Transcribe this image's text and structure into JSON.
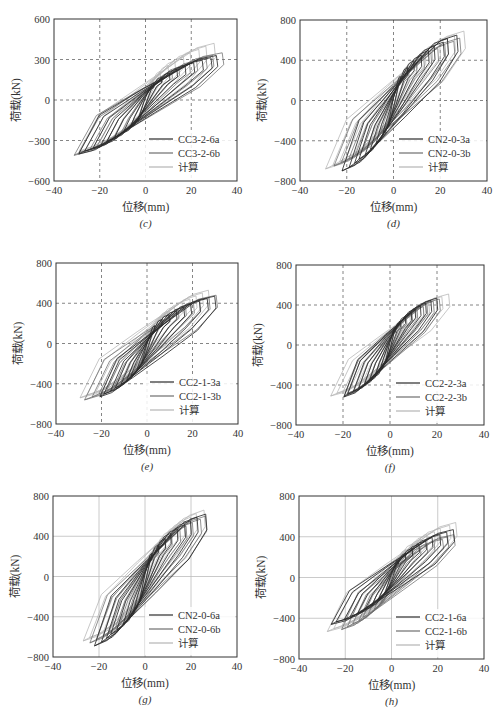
{
  "figure": {
    "xlabel": "位移(mm)",
    "ylabel": "荷载(kN)"
  },
  "series_styles": {
    "a": {
      "color": "#2b2b2b"
    },
    "b": {
      "color": "#6e6e6e"
    },
    "calc": {
      "color": "#b4b4b4"
    }
  },
  "chart_data": [
    {
      "type": "line",
      "panel": "c",
      "caption": "(c)",
      "xlabel": "位移(mm)",
      "ylabel": "荷载(kN)",
      "xlim": [
        -40,
        40
      ],
      "ylim": [
        -600,
        600
      ],
      "xticks": [
        -40,
        -20,
        0,
        20,
        40
      ],
      "yticks": [
        -600,
        -300,
        0,
        300,
        600
      ],
      "grid": "dashed at inner ticks",
      "legend": "bottom-right",
      "series": [
        {
          "name": "CC3-2-6a",
          "style": "a",
          "peak_disp": [
            32,
            -30
          ],
          "peak_load": [
            330,
            -400
          ]
        },
        {
          "name": "CC3-2-6b",
          "style": "b",
          "peak_disp": [
            34,
            -32
          ],
          "peak_load": [
            350,
            -410
          ]
        },
        {
          "name": "计算",
          "style": "calc",
          "peak_disp": [
            30,
            -30
          ],
          "peak_load": [
            420,
            -380
          ]
        }
      ]
    },
    {
      "type": "line",
      "panel": "d",
      "caption": "(d)",
      "xlabel": "位移(mm)",
      "ylabel": "荷载(kN)",
      "xlim": [
        -40,
        40
      ],
      "ylim": [
        -800,
        800
      ],
      "xticks": [
        -40,
        -20,
        0,
        20,
        40
      ],
      "yticks": [
        -800,
        -400,
        0,
        400,
        800
      ],
      "grid": "dashed at inner ticks",
      "legend": "bottom-right",
      "series": [
        {
          "name": "CN2-0-3a",
          "style": "a",
          "peak_disp": [
            27,
            -22
          ],
          "peak_load": [
            650,
            -700
          ]
        },
        {
          "name": "CN2-0-3b",
          "style": "b",
          "peak_disp": [
            29,
            -25
          ],
          "peak_load": [
            620,
            -650
          ]
        },
        {
          "name": "计算",
          "style": "calc",
          "peak_disp": [
            30,
            -30
          ],
          "peak_load": [
            690,
            -680
          ]
        }
      ]
    },
    {
      "type": "line",
      "panel": "e",
      "caption": "(e)",
      "xlabel": "位移(mm)",
      "ylabel": "荷载(kN)",
      "xlim": [
        -40,
        40
      ],
      "ylim": [
        -800,
        800
      ],
      "xticks": [
        -40,
        -20,
        0,
        20,
        40
      ],
      "yticks": [
        -800,
        -400,
        0,
        400,
        800
      ],
      "grid": "dashed at inner ticks",
      "legend": "bottom-right",
      "series": [
        {
          "name": "CC2-1-3a",
          "style": "a",
          "peak_disp": [
            30,
            -21
          ],
          "peak_load": [
            470,
            -530
          ]
        },
        {
          "name": "CC2-1-3b",
          "style": "b",
          "peak_disp": [
            31,
            -27
          ],
          "peak_load": [
            480,
            -560
          ]
        },
        {
          "name": "计算",
          "style": "calc",
          "peak_disp": [
            28,
            -30
          ],
          "peak_load": [
            530,
            -540
          ]
        }
      ]
    },
    {
      "type": "line",
      "panel": "f",
      "caption": "(f)",
      "xlabel": "位移(mm)",
      "ylabel": "荷载(kN)",
      "xlim": [
        -40,
        40
      ],
      "ylim": [
        -800,
        800
      ],
      "xticks": [
        -40,
        -20,
        0,
        20,
        40
      ],
      "yticks": [
        -800,
        -400,
        0,
        400,
        800
      ],
      "grid": "dashed at inner ticks",
      "legend": "bottom-right",
      "series": [
        {
          "name": "CC2-2-3a",
          "style": "a",
          "peak_disp": [
            20,
            -20
          ],
          "peak_load": [
            470,
            -520
          ]
        },
        {
          "name": "CC2-2-3b",
          "style": "b",
          "peak_disp": [
            21,
            -20
          ],
          "peak_load": [
            460,
            -510
          ]
        },
        {
          "name": "计算",
          "style": "calc",
          "peak_disp": [
            25,
            -25
          ],
          "peak_load": [
            510,
            -510
          ]
        }
      ]
    },
    {
      "type": "line",
      "panel": "g",
      "caption": "(g)",
      "xlabel": "位移(mm)",
      "ylabel": "荷载(kN)",
      "xlim": [
        -40,
        40
      ],
      "ylim": [
        -800,
        800
      ],
      "xticks": [
        -40,
        -20,
        0,
        20,
        40
      ],
      "yticks": [
        -800,
        -400,
        0,
        400,
        800
      ],
      "grid": "solid light at inner ticks",
      "legend": "bottom-right",
      "series": [
        {
          "name": "CN2-0-6a",
          "style": "a",
          "peak_disp": [
            26,
            -22
          ],
          "peak_load": [
            620,
            -690
          ]
        },
        {
          "name": "CN2-0-6b",
          "style": "b",
          "peak_disp": [
            27,
            -24
          ],
          "peak_load": [
            600,
            -660
          ]
        },
        {
          "name": "计算",
          "style": "calc",
          "peak_disp": [
            26,
            -27
          ],
          "peak_load": [
            660,
            -640
          ]
        }
      ]
    },
    {
      "type": "line",
      "panel": "h",
      "caption": "(h)",
      "xlabel": "位移(mm)",
      "ylabel": "荷载(kN)",
      "xlim": [
        -40,
        40
      ],
      "ylim": [
        -800,
        800
      ],
      "xticks": [
        -40,
        -20,
        0,
        20,
        40
      ],
      "yticks": [
        -800,
        -400,
        0,
        400,
        800
      ],
      "grid": "solid light at inner ticks",
      "legend": "bottom-right",
      "series": [
        {
          "name": "CC2-1-6a",
          "style": "a",
          "peak_disp": [
            27,
            -27
          ],
          "peak_load": [
            470,
            -460
          ]
        },
        {
          "name": "CC2-1-6b",
          "style": "b",
          "peak_disp": [
            28,
            -22
          ],
          "peak_load": [
            420,
            -510
          ]
        },
        {
          "name": "计算",
          "style": "calc",
          "peak_disp": [
            28,
            -28
          ],
          "peak_load": [
            540,
            -530
          ]
        }
      ]
    }
  ]
}
